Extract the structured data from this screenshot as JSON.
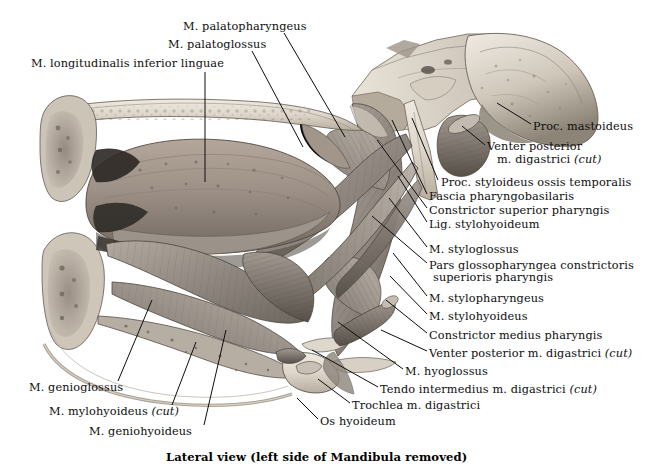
{
  "plate": {
    "title_caption": "Lateral view (left side of Mandibula removed)",
    "view_kind": "anatomical-illustration",
    "palette": {
      "background": "#ffffff",
      "ink": "#0d0d0d",
      "bone_light": "#e6e0d6",
      "bone_mid": "#cfc6b8",
      "bone_dark": "#9b9184",
      "muscle_light": "#b9b1a8",
      "muscle_mid": "#8e867d",
      "muscle_dark": "#5d564f",
      "cavity_dark": "#2b2723",
      "mucosa": "#a89a8f"
    }
  },
  "labels": {
    "top": [
      {
        "id": "m-palatopharyngeus",
        "text": "M. palatopharyngeus",
        "x": 183,
        "y": 27,
        "align": "left"
      },
      {
        "id": "m-palatoglossus",
        "text": "M. palatoglossus",
        "x": 168,
        "y": 45,
        "align": "left"
      },
      {
        "id": "m-longitudinalis-inferior-linguae",
        "text": "M. longitudinalis inferior linguae",
        "x": 31,
        "y": 64,
        "align": "left"
      }
    ],
    "right": [
      {
        "id": "proc-mastoideus",
        "text": "Proc. mastoideus",
        "x": 533,
        "y": 127,
        "align": "left"
      },
      {
        "id": "venter-posterior-m-digastrici-cut",
        "line1": "Venter posterior",
        "line2": "m. digastrici ",
        "italic2": "(cut)",
        "x": 487,
        "y": 147,
        "align": "left"
      },
      {
        "id": "proc-styloideus-ossis-temporalis",
        "text": "Proc. styloideus ossis temporalis",
        "x": 441,
        "y": 183,
        "align": "left"
      },
      {
        "id": "fascia-pharyngobasilaris",
        "text": "Fascia pharyngobasilaris",
        "x": 429,
        "y": 197,
        "align": "left"
      },
      {
        "id": "constrictor-superior-pharyngis",
        "text": "Constrictor superior pharyngis",
        "x": 429,
        "y": 211,
        "align": "left"
      },
      {
        "id": "lig-stylohyoideum",
        "text": "Lig. stylohyoideum",
        "x": 429,
        "y": 225,
        "align": "left"
      },
      {
        "id": "m-styloglossus",
        "text": "M. styloglossus",
        "x": 429,
        "y": 250,
        "align": "left"
      },
      {
        "id": "pars-glossopharyngea",
        "line1": "Pars glossopharyngea constrictoris",
        "line2": "superioris pharyngis",
        "x": 429,
        "y": 272,
        "align": "left"
      },
      {
        "id": "m-stylopharyngeus",
        "text": "M. stylopharyngeus",
        "x": 429,
        "y": 299,
        "align": "left"
      },
      {
        "id": "m-stylohyoideus",
        "text": "M. stylohyoideus",
        "x": 429,
        "y": 317,
        "align": "left"
      },
      {
        "id": "constrictor-medius-pharyngis",
        "text": "Constrictor medius pharyngis",
        "x": 429,
        "y": 336,
        "align": "left"
      },
      {
        "id": "venter-posterior-m-digastrici-cut-2",
        "text": "Venter posterior m. digastrici ",
        "italic": "(cut)",
        "x": 429,
        "y": 354,
        "align": "left"
      },
      {
        "id": "m-hyoglossus",
        "text": "M. hyoglossus",
        "x": 405,
        "y": 372,
        "align": "left"
      },
      {
        "id": "tendo-intermedius-m-digastrici-cut",
        "text": "Tendo intermedius m. digastrici ",
        "italic": "(cut)",
        "x": 380,
        "y": 390,
        "align": "left"
      },
      {
        "id": "trochlea-m-digastrici",
        "text": "Trochlea m. digastrici",
        "x": 352,
        "y": 406,
        "align": "left"
      },
      {
        "id": "os-hyoideum",
        "text": "Os hyoideum",
        "x": 320,
        "y": 422,
        "align": "left"
      }
    ],
    "bottom_left": [
      {
        "id": "m-genioglossus",
        "text": "M. genioglossus",
        "x": 29,
        "y": 388,
        "align": "left"
      },
      {
        "id": "m-mylohyoideus-cut",
        "text": "M. mylohyoideus ",
        "italic": "(cut)",
        "x": 49,
        "y": 412,
        "align": "left"
      },
      {
        "id": "m-geniohyoideus",
        "text": "M. geniohyoideus",
        "x": 89,
        "y": 432,
        "align": "left"
      }
    ]
  },
  "leaders": [
    {
      "id": "leader-palatopharyngeus",
      "x1": 284,
      "y1": 33,
      "x2": 345,
      "y2": 137
    },
    {
      "id": "leader-palatoglossus",
      "x1": 252,
      "y1": 51,
      "x2": 303,
      "y2": 147
    },
    {
      "id": "leader-longitudinalis",
      "x1": 205,
      "y1": 72,
      "x2": 205,
      "y2": 182
    },
    {
      "id": "leader-proc-mastoideus",
      "x1": 531,
      "y1": 124,
      "x2": 497,
      "y2": 103
    },
    {
      "id": "leader-venter-post-dig",
      "x1": 485,
      "y1": 145,
      "x2": 462,
      "y2": 126
    },
    {
      "id": "leader-proc-styloideus",
      "x1": 438,
      "y1": 180,
      "x2": 412,
      "y2": 118
    },
    {
      "id": "leader-fascia-pharyngo",
      "x1": 427,
      "y1": 194,
      "x2": 392,
      "y2": 120
    },
    {
      "id": "leader-constr-sup",
      "x1": 427,
      "y1": 208,
      "x2": 377,
      "y2": 140
    },
    {
      "id": "leader-lig-stylohyoideum",
      "x1": 427,
      "y1": 222,
      "x2": 398,
      "y2": 176
    },
    {
      "id": "leader-m-styloglossus",
      "x1": 427,
      "y1": 247,
      "x2": 389,
      "y2": 198
    },
    {
      "id": "leader-pars-glossopharyngea",
      "x1": 427,
      "y1": 263,
      "x2": 372,
      "y2": 216
    },
    {
      "id": "leader-m-stylopharyngeus",
      "x1": 427,
      "y1": 296,
      "x2": 393,
      "y2": 253
    },
    {
      "id": "leader-m-stylohyoideus",
      "x1": 427,
      "y1": 314,
      "x2": 390,
      "y2": 276
    },
    {
      "id": "leader-constr-med",
      "x1": 427,
      "y1": 333,
      "x2": 386,
      "y2": 300
    },
    {
      "id": "leader-venter-post-dig2",
      "x1": 427,
      "y1": 351,
      "x2": 381,
      "y2": 330
    },
    {
      "id": "leader-m-hyoglossus",
      "x1": 403,
      "y1": 369,
      "x2": 338,
      "y2": 322
    },
    {
      "id": "leader-tendo-intermedius",
      "x1": 378,
      "y1": 387,
      "x2": 312,
      "y2": 350
    },
    {
      "id": "leader-trochlea",
      "x1": 350,
      "y1": 403,
      "x2": 318,
      "y2": 379
    },
    {
      "id": "leader-os-hyoideum",
      "x1": 318,
      "y1": 419,
      "x2": 297,
      "y2": 398
    },
    {
      "id": "leader-m-genioglossus",
      "x1": 118,
      "y1": 381,
      "x2": 152,
      "y2": 300
    },
    {
      "id": "leader-m-mylohyoideus",
      "x1": 172,
      "y1": 405,
      "x2": 196,
      "y2": 342
    },
    {
      "id": "leader-m-geniohyoideus",
      "x1": 204,
      "y1": 425,
      "x2": 226,
      "y2": 330
    }
  ]
}
